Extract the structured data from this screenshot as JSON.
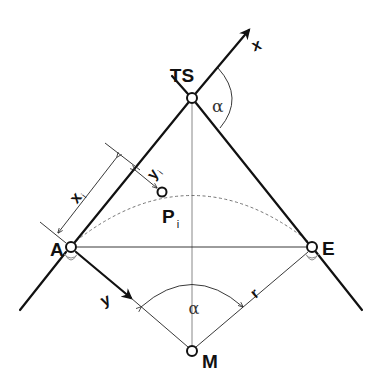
{
  "diagram": {
    "points": {
      "TS": {
        "label": "TS"
      },
      "A": {
        "label": "A"
      },
      "E": {
        "label": "E"
      },
      "M": {
        "label": "M"
      },
      "Pi": {
        "label": "P",
        "subscript": "i"
      }
    },
    "axes": {
      "x": {
        "label": "x"
      },
      "y": {
        "label": "y"
      }
    },
    "dimensions": {
      "xi": {
        "label": "x",
        "subscript": "i"
      },
      "yi": {
        "label": "y",
        "subscript": "i"
      },
      "radius": {
        "label": "r"
      }
    },
    "angles": {
      "deflection": {
        "label": "α"
      },
      "central": {
        "label": "α"
      }
    }
  }
}
